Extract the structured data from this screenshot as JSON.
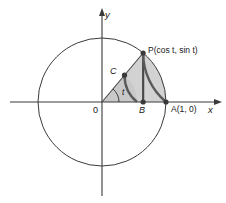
{
  "figure": {
    "background_color": "#ffffff",
    "stroke_color": "#3a3a3a",
    "heavy_stroke_color": "#4a4a4a",
    "sector_fill_color": "#d2d2d2",
    "inner_sector_fill_color": "#c9c9c9",
    "point_color": "#3a3a3a"
  },
  "axes": {
    "x_label": "x",
    "y_label": "y",
    "origin_label": "0"
  },
  "points": {
    "P": {
      "label": "P(cos t, sin t)",
      "name": "P",
      "coords_text": "(cos t, sin t)"
    },
    "A": {
      "label": "A(1, 0)",
      "name": "A",
      "coords_text": "(1, 0)"
    },
    "B": {
      "label": "B",
      "name": "B"
    },
    "C": {
      "label": "C",
      "name": "C"
    }
  },
  "angle": {
    "label": "t"
  },
  "geometry": {
    "center_x": 102,
    "center_y": 102,
    "radius": 64,
    "inner_radius": 35,
    "angle_degrees": 50,
    "angle_arc_radius": 17
  }
}
